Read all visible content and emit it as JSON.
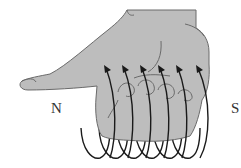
{
  "diagram": {
    "labels": {
      "north": "N",
      "south": "S"
    },
    "elements": {
      "hand": "right hand, thumb pointing left toward N, fingers curled",
      "coil_loops": 6,
      "arrow_direction": "up and over the fingers (current direction)"
    },
    "colors": {
      "hand_fill": "#bdbdbd",
      "hand_outline": "#6a6a6a",
      "coil": "#1a1a1a",
      "background": "#ffffff",
      "label": "#333333"
    }
  }
}
